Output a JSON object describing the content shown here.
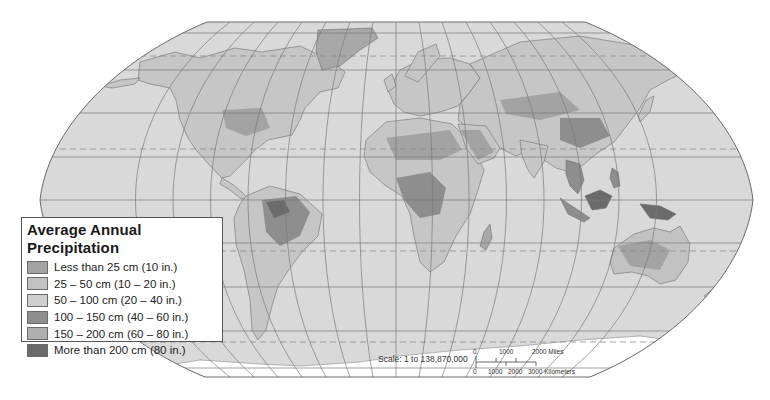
{
  "map": {
    "projection": "robinson-like world map",
    "colors": {
      "ocean": "#d9d9d9",
      "graticule": "#7a7a7a",
      "outline": "#6a6a6a",
      "antarctica": "#ffffff"
    }
  },
  "legend": {
    "title": "Average Annual Precipitation",
    "items": [
      {
        "label": "Less than 25 cm (10 in.)",
        "color": "#a3a3a3"
      },
      {
        "label": "25 – 50 cm (10 – 20 in.)",
        "color": "#c2c2c2"
      },
      {
        "label": "50 – 100 cm (20 – 40 in.)",
        "color": "#cfcfcf"
      },
      {
        "label": "100 – 150 cm (40 – 60 in.)",
        "color": "#8e8e8e"
      },
      {
        "label": "150 – 200 cm (60 – 80 in.)",
        "color": "#b0b0b0"
      },
      {
        "label": "More than 200 cm (80 in.)",
        "color": "#6b6b6b"
      }
    ]
  },
  "scale": {
    "text": "Scale:  1 to 138,870,000",
    "miles_ticks": [
      "0",
      "1000",
      "2000 Miles"
    ],
    "km_ticks": [
      "0",
      "1000",
      "2000",
      "3000 Kilometers"
    ]
  }
}
